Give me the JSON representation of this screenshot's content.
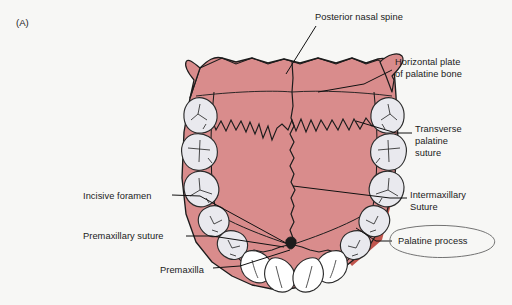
{
  "figure": {
    "panel_label": "(A)",
    "background_color": "#f7f7f5"
  },
  "palette": {
    "palate_fill": "#d98c8c",
    "palate_fill_light": "#df9a99",
    "palate_shadow": "#c0554d",
    "tooth_fill": "#e9e9ee",
    "tooth_outline": "#2b2b2b",
    "outline": "#1c1c1c",
    "leader_line": "#111111",
    "callout_ellipse": "#6b6b6b",
    "text": "#1a1a1a"
  },
  "labels": [
    {
      "id": "posterior-nasal-spine",
      "text": "Posterior nasal spine",
      "lines": [
        "Posterior nasal spine"
      ],
      "x": 315,
      "y": 12,
      "align": "left"
    },
    {
      "id": "horizontal-plate-of-palatine-bone",
      "text": "Horizontal plate of palatine bone",
      "lines": [
        "Horizontal plate",
        "of palatine bone"
      ],
      "x": 395,
      "y": 57,
      "align": "left"
    },
    {
      "id": "transverse-palatine-suture",
      "text": "Transverse palatine suture",
      "lines": [
        "Transverse",
        "palatine",
        "suture"
      ],
      "x": 415,
      "y": 124,
      "align": "left"
    },
    {
      "id": "intermaxillary-suture",
      "text": "Intermaxillary Suture",
      "lines": [
        "Intermaxillary",
        "Suture"
      ],
      "x": 410,
      "y": 190,
      "align": "left"
    },
    {
      "id": "palatine-process",
      "text": "Palatine process",
      "lines": [
        "Palatine process"
      ],
      "x": 398,
      "y": 236,
      "align": "left"
    },
    {
      "id": "incisive-foramen",
      "text": "Incisive foramen",
      "lines": [
        "Incisive foramen"
      ],
      "x": 83,
      "y": 191,
      "align": "left"
    },
    {
      "id": "premaxillary-suture",
      "text": "Premaxillary suture",
      "lines": [
        "Premaxillary suture"
      ],
      "x": 83,
      "y": 231,
      "align": "left"
    },
    {
      "id": "premaxilla",
      "text": "Premaxilla",
      "lines": [
        "Premaxilla"
      ],
      "x": 160,
      "y": 265,
      "align": "left"
    }
  ],
  "anatomy_parts": [
    "posterior nasal spine",
    "horizontal plate of palatine bone",
    "transverse palatine suture",
    "intermaxillary suture",
    "palatine process",
    "incisive foramen",
    "premaxillary suture",
    "premaxilla",
    "maxillary teeth"
  ]
}
